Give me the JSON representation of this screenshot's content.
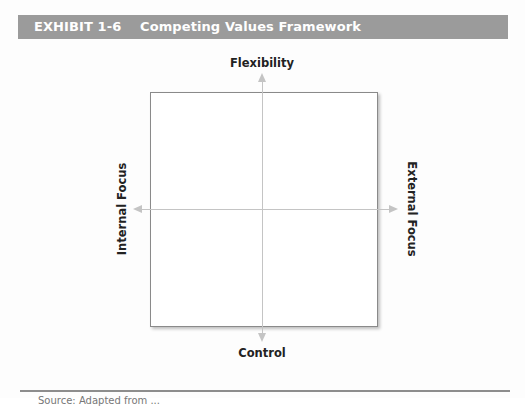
{
  "exhibit": {
    "number": "EXHIBIT 1-6",
    "title": "Competing Values Framework",
    "header_bg": "#9b9b9b",
    "header_fg": "#ffffff"
  },
  "diagram": {
    "type": "quadrant-framework",
    "axes": {
      "top": "Flexibility",
      "bottom": "Control",
      "left": "Internal Focus",
      "right": "External Focus"
    },
    "quadrants": [
      {
        "position": "top-left",
        "label": ""
      },
      {
        "position": "top-right",
        "label": ""
      },
      {
        "position": "bottom-left",
        "label": ""
      },
      {
        "position": "bottom-right",
        "label": ""
      }
    ],
    "axis_color": "#c4c4c4",
    "box_border_color": "#8a8a8a"
  },
  "footer": {
    "caption": "Source: Adapted from ..."
  }
}
